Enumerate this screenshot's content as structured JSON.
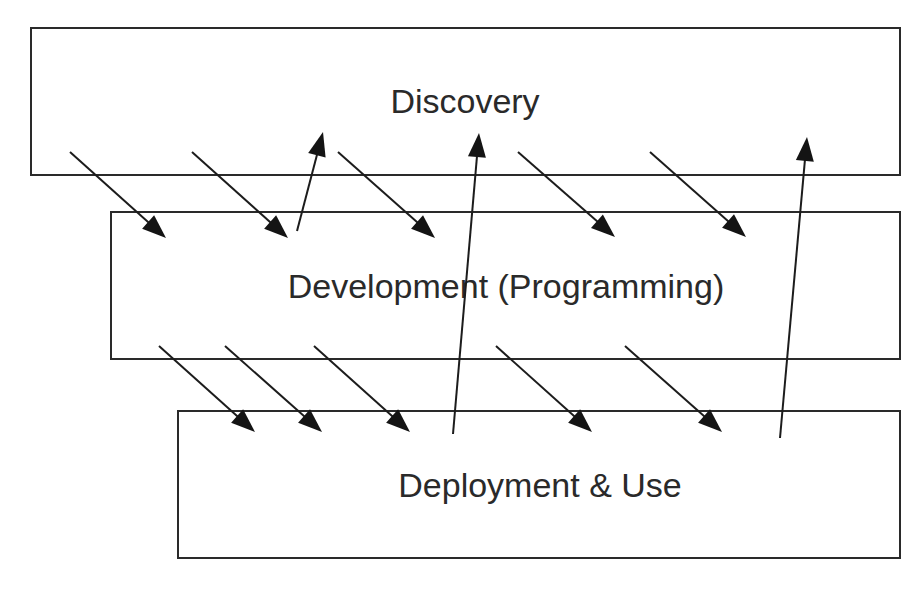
{
  "diagram": {
    "type": "layered-process-flow",
    "layers": [
      {
        "id": "discovery",
        "label": "Discovery",
        "x": 31,
        "y": 28,
        "w": 869,
        "h": 147,
        "label_x": 465,
        "label_y": 104
      },
      {
        "id": "development",
        "label": "Development (Programming)",
        "x": 111,
        "y": 212,
        "w": 789,
        "h": 147,
        "label_x": 506,
        "label_y": 289
      },
      {
        "id": "deployment",
        "label": "Deployment & Use",
        "x": 178,
        "y": 411,
        "w": 722,
        "h": 147,
        "label_x": 540,
        "label_y": 488
      }
    ],
    "arrows": [
      {
        "from": "discovery",
        "to": "development",
        "direction": "down",
        "x1": 70,
        "y1": 152,
        "x2": 166,
        "y2": 238
      },
      {
        "from": "discovery",
        "to": "development",
        "direction": "down",
        "x1": 192,
        "y1": 152,
        "x2": 288,
        "y2": 238
      },
      {
        "from": "development",
        "to": "discovery",
        "direction": "up",
        "x1": 297,
        "y1": 231,
        "x2": 323,
        "y2": 132
      },
      {
        "from": "discovery",
        "to": "development",
        "direction": "down",
        "x1": 338,
        "y1": 152,
        "x2": 435,
        "y2": 238
      },
      {
        "from": "deployment",
        "to": "discovery",
        "direction": "up",
        "x1": 453,
        "y1": 434,
        "x2": 479,
        "y2": 133
      },
      {
        "from": "discovery",
        "to": "development",
        "direction": "down",
        "x1": 518,
        "y1": 152,
        "x2": 615,
        "y2": 237
      },
      {
        "from": "discovery",
        "to": "development",
        "direction": "down",
        "x1": 650,
        "y1": 152,
        "x2": 746,
        "y2": 237
      },
      {
        "from": "deployment",
        "to": "discovery",
        "direction": "up",
        "x1": 780,
        "y1": 438,
        "x2": 807,
        "y2": 137
      },
      {
        "from": "development",
        "to": "deployment",
        "direction": "down",
        "x1": 159,
        "y1": 346,
        "x2": 255,
        "y2": 432
      },
      {
        "from": "development",
        "to": "deployment",
        "direction": "down",
        "x1": 225,
        "y1": 346,
        "x2": 322,
        "y2": 432
      },
      {
        "from": "development",
        "to": "deployment",
        "direction": "down",
        "x1": 314,
        "y1": 346,
        "x2": 410,
        "y2": 432
      },
      {
        "from": "development",
        "to": "deployment",
        "direction": "down",
        "x1": 496,
        "y1": 346,
        "x2": 592,
        "y2": 432
      },
      {
        "from": "development",
        "to": "deployment",
        "direction": "down",
        "x1": 625,
        "y1": 346,
        "x2": 722,
        "y2": 432
      }
    ]
  }
}
